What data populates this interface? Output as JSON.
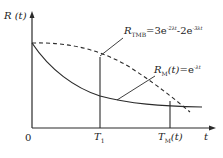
{
  "diagram": {
    "y_axis_label": "R (t)",
    "x_axis_label": "t",
    "origin_label": "0",
    "x_ticks": [
      {
        "label": "T",
        "sub": "1"
      },
      {
        "label": "T",
        "sub": "M",
        "suffix": "(t)"
      }
    ],
    "curves": [
      {
        "name": "R_TMB",
        "style": "dashed",
        "label_main": "R",
        "label_sub": "TMB",
        "formula": "=3e",
        "exp1": "-2λt",
        "mid": "-2e",
        "exp2": "-3λt"
      },
      {
        "name": "R_M",
        "style": "solid",
        "label_main": "R",
        "label_sub": "M",
        "label_arg": "(t)",
        "formula": "=e",
        "exp": "-λt"
      }
    ],
    "colors": {
      "line": "#2a2a2a",
      "background": "#ffffff"
    }
  }
}
